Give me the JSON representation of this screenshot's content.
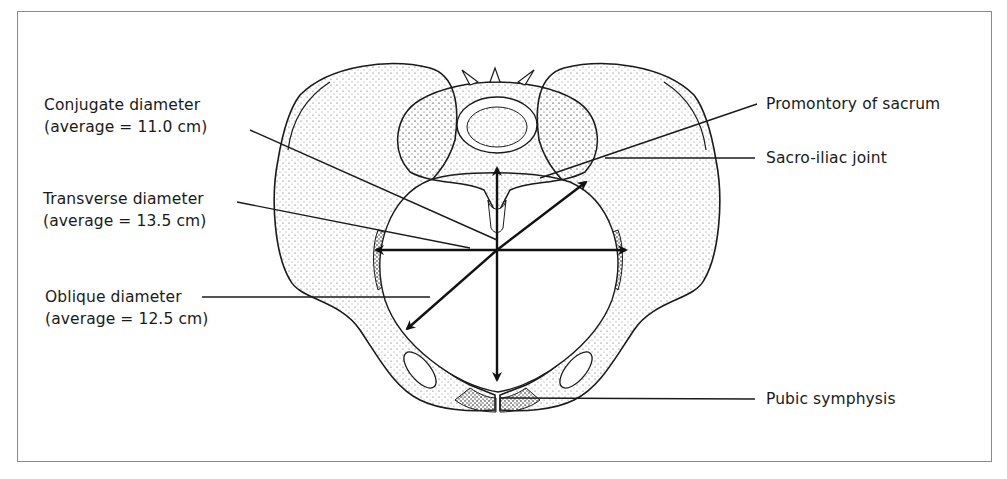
{
  "figure": {
    "labels_left": [
      {
        "id": "conjugate",
        "title": "Conjugate diameter",
        "detail": "(average = 11.0 cm)"
      },
      {
        "id": "transverse",
        "title": "Transverse diameter",
        "detail": "(average = 13.5 cm)"
      },
      {
        "id": "oblique",
        "title": "Oblique diameter",
        "detail": "(average = 12.5 cm)"
      }
    ],
    "labels_right": [
      {
        "id": "promontory",
        "title": "Promontory of sacrum"
      },
      {
        "id": "sacroiliac",
        "title": "Sacro-iliac joint"
      },
      {
        "id": "pubic",
        "title": "Pubic symphysis"
      }
    ],
    "colors": {
      "ink": "#1a1a1a",
      "frame": "#8a8a8a",
      "background": "#ffffff"
    }
  }
}
